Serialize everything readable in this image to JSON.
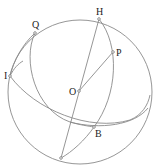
{
  "diagram": {
    "title": "",
    "points": [
      {
        "id": "H",
        "label": "H"
      },
      {
        "id": "Q",
        "label": "Q"
      },
      {
        "id": "P",
        "label": "P"
      },
      {
        "id": "I",
        "label": "I"
      },
      {
        "id": "O",
        "label": "O"
      },
      {
        "id": "B",
        "label": "B"
      }
    ],
    "segments": [
      {
        "from": "H",
        "to": "bottom",
        "description": "diameter through O"
      },
      {
        "from": "O",
        "to": "P",
        "description": "radius"
      }
    ],
    "arcs": [
      "great sphere outline",
      "meridian arc H-P-B-bottom",
      "meridian arc Q-down to B",
      "arc I-B-right",
      "arc I-lower-right"
    ]
  }
}
